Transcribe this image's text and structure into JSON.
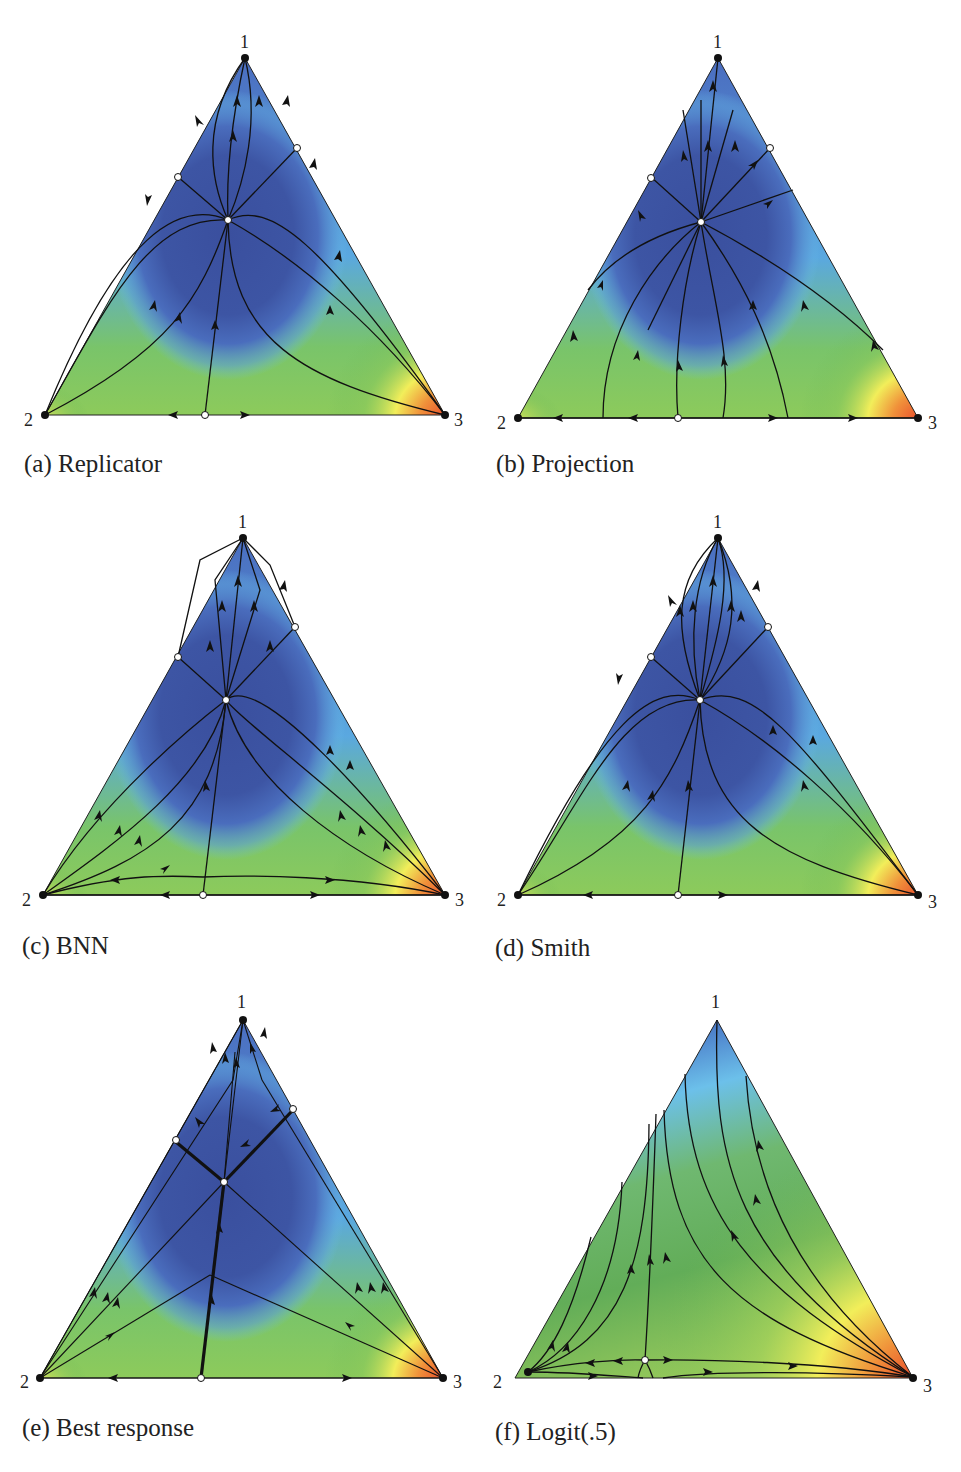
{
  "figure": {
    "panels": [
      {
        "id": "a",
        "caption": "(a) Replicator",
        "vertices": [
          "1",
          "2",
          "3"
        ]
      },
      {
        "id": "b",
        "caption": "(b) Projection",
        "vertices": [
          "1",
          "2",
          "3"
        ]
      },
      {
        "id": "c",
        "caption": "(c) BNN",
        "vertices": [
          "1",
          "2",
          "3"
        ]
      },
      {
        "id": "d",
        "caption": "(d) Smith",
        "vertices": [
          "1",
          "2",
          "3"
        ]
      },
      {
        "id": "e",
        "caption": "(e) Best response",
        "vertices": [
          "1",
          "2",
          "3"
        ]
      },
      {
        "id": "f",
        "caption": "(f) Logit(.5)",
        "vertices": [
          "1",
          "2",
          "3"
        ]
      }
    ],
    "colors": {
      "deep_blue": "#3b4fa0",
      "mid_blue": "#4a7ac8",
      "light_blue": "#6cc0ea",
      "green": "#6cb85a",
      "yellow": "#f2ee5a",
      "orange": "#f0913a",
      "red": "#e8412a",
      "curve": "#111111",
      "rest_point_open": "#ffffff"
    }
  }
}
